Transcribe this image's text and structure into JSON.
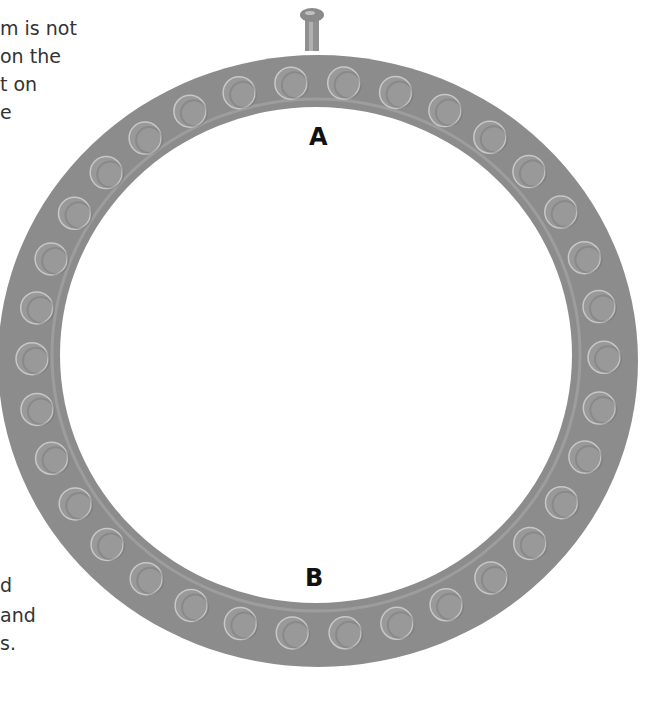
{
  "text_fragments": {
    "top": [
      "m is not",
      "on the",
      "t on",
      "e"
    ],
    "bottom": [
      "d",
      "and",
      "s."
    ]
  },
  "labels": {
    "a": "A",
    "b": "B"
  },
  "ring": {
    "color": "#8c8c8c",
    "highlight": "#a8a8a8",
    "stud_color": "#999999",
    "stud_rim": "#c8c8c8",
    "outer": {
      "cx": 318,
      "cy": 361,
      "rx": 320,
      "ry": 306
    },
    "inner": {
      "cx": 316,
      "cy": 355,
      "rx": 256,
      "ry": 248
    },
    "stud_path": {
      "cx": 318,
      "cy": 358,
      "rx": 286,
      "ry": 276
    },
    "stud_count": 34,
    "stud_radius": 16
  },
  "peg": {
    "x": 312,
    "y": 12
  }
}
